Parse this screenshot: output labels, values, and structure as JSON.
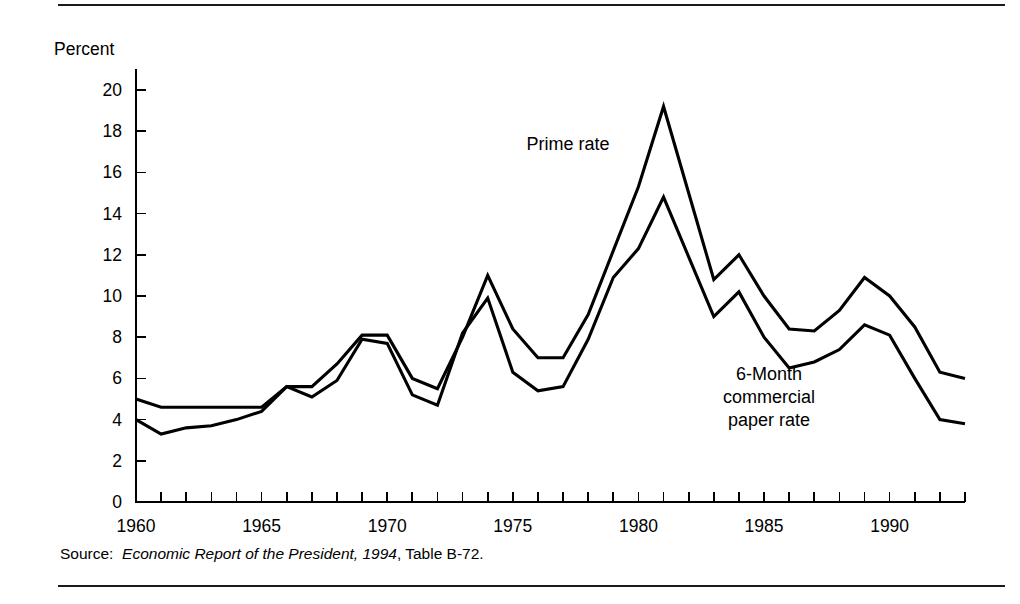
{
  "figure": {
    "background": "#ffffff",
    "ink": "#000000",
    "rules": {
      "top": true,
      "bottom": true
    }
  },
  "source": {
    "label": "Source:",
    "title": "Economic Report of the President, 1994",
    "suffix": ", Table B-72."
  },
  "chart_data": {
    "type": "line",
    "title": "",
    "subtitle": "",
    "xlabel": "",
    "ylabel": "Percent",
    "xlim": [
      1960,
      1993
    ],
    "ylim": [
      0,
      21
    ],
    "grid": false,
    "legend_position": "inline-annotations",
    "x_ticks_major": [
      1960,
      1965,
      1970,
      1975,
      1980,
      1985,
      1990
    ],
    "x_ticks_minor_step": 1,
    "y_ticks": [
      0,
      2,
      4,
      6,
      8,
      10,
      12,
      14,
      16,
      18,
      20
    ],
    "x": [
      1960,
      1961,
      1962,
      1963,
      1964,
      1965,
      1966,
      1967,
      1968,
      1969,
      1970,
      1971,
      1972,
      1973,
      1974,
      1975,
      1976,
      1977,
      1978,
      1979,
      1980,
      1981,
      1982,
      1983,
      1984,
      1985,
      1986,
      1987,
      1988,
      1989,
      1990,
      1991,
      1992,
      1993
    ],
    "series": [
      {
        "name": "Prime rate",
        "annotation": "Prime rate",
        "annotation_x": 1977.2,
        "annotation_y": 17.1,
        "values": [
          5.0,
          4.6,
          4.6,
          4.6,
          4.6,
          4.6,
          5.6,
          5.6,
          6.7,
          8.1,
          8.1,
          6.0,
          5.5,
          8.0,
          11.0,
          8.4,
          7.0,
          7.0,
          9.1,
          12.2,
          15.3,
          19.2,
          15.0,
          10.8,
          12.0,
          10.0,
          8.4,
          8.3,
          9.3,
          10.9,
          10.0,
          8.5,
          6.3,
          6.0
        ]
      },
      {
        "name": "6-Month commercial paper rate",
        "annotation": "6-Month commercial paper rate",
        "annotation_lines": [
          "6-Month",
          "commercial",
          "paper rate"
        ],
        "annotation_x": 1985.2,
        "annotation_y": 5.9,
        "values": [
          4.0,
          3.3,
          3.6,
          3.7,
          4.0,
          4.4,
          5.6,
          5.1,
          5.9,
          7.9,
          7.7,
          5.2,
          4.7,
          8.2,
          9.9,
          6.3,
          5.4,
          5.6,
          7.9,
          10.9,
          12.3,
          14.8,
          11.9,
          9.0,
          10.2,
          8.0,
          6.5,
          6.8,
          7.4,
          8.6,
          8.1,
          6.0,
          4.0,
          3.8
        ]
      }
    ]
  },
  "annotations": {
    "prime": "Prime rate",
    "paper_line1": "6-Month",
    "paper_line2": "commercial",
    "paper_line3": "paper rate"
  }
}
